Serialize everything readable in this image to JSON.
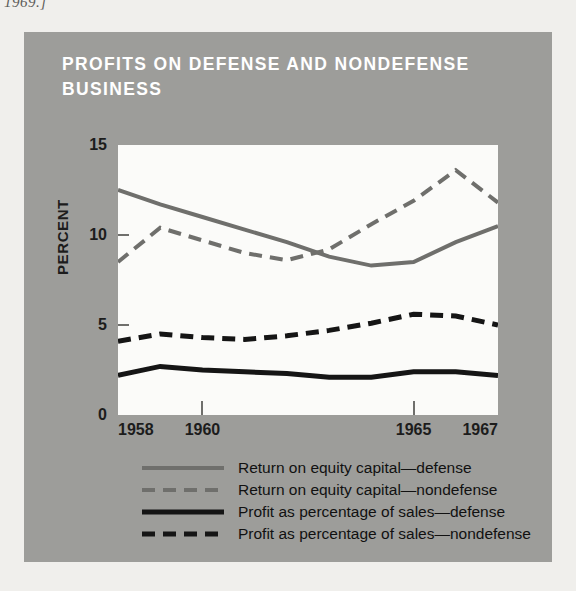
{
  "page": {
    "header_fragment": "1969.]"
  },
  "figure": {
    "title": "PROFITS ON DEFENSE AND NONDEFENSE BUSINESS",
    "panel_color": "#9d9d9a",
    "plot_background": "#fbfbf9",
    "title_color": "#ffffff"
  },
  "chart_data": {
    "type": "line",
    "title": "PROFITS ON DEFENSE AND NONDEFENSE BUSINESS",
    "xlabel": "",
    "ylabel": "PERCENT",
    "xlim": [
      1958,
      1967
    ],
    "ylim": [
      0,
      15
    ],
    "yticks": [
      0,
      5,
      10,
      15
    ],
    "ytick_labels": [
      "0",
      "5",
      "10",
      "15"
    ],
    "xticks": [
      1958,
      1960,
      1965,
      1967
    ],
    "xtick_labels": [
      "1958",
      "1960",
      "1965",
      "1967"
    ],
    "x": [
      1958,
      1959,
      1960,
      1961,
      1962,
      1963,
      1964,
      1965,
      1966,
      1967
    ],
    "grid": false,
    "legend_position": "below",
    "series": [
      {
        "name": "Return on equity capital—defense",
        "color": "#6f6f6c",
        "style": "solid",
        "width": 4,
        "values": [
          12.5,
          11.7,
          11.0,
          10.3,
          9.6,
          8.8,
          8.3,
          8.5,
          9.6,
          10.5
        ]
      },
      {
        "name": "Return on equity capital—nondefense",
        "color": "#6f6f6c",
        "style": "dashed",
        "width": 4,
        "values": [
          8.5,
          10.4,
          9.7,
          9.0,
          8.6,
          9.2,
          10.6,
          11.9,
          13.6,
          11.8
        ]
      },
      {
        "name": "Profit as percentage of sales—defense",
        "color": "#151515",
        "style": "solid",
        "width": 5,
        "values": [
          2.2,
          2.7,
          2.5,
          2.4,
          2.3,
          2.1,
          2.1,
          2.4,
          2.4,
          2.2
        ]
      },
      {
        "name": "Profit as percentage of sales—nondefense",
        "color": "#151515",
        "style": "dashed",
        "width": 5,
        "values": [
          4.1,
          4.5,
          4.3,
          4.2,
          4.4,
          4.7,
          5.1,
          5.6,
          5.5,
          5.0
        ]
      }
    ]
  },
  "legend": {
    "entries": [
      {
        "label": "Return on equity capital—defense",
        "swatch": "gray-solid"
      },
      {
        "label": "Return on equity capital—nondefense",
        "swatch": "gray-dash"
      },
      {
        "label": "Profit as percentage of sales—defense",
        "swatch": "black-solid"
      },
      {
        "label": "Profit as percentage of sales—nondefense",
        "swatch": "black-dash"
      }
    ]
  }
}
